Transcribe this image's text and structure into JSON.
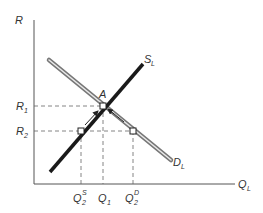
{
  "diagram": {
    "type": "labor-market-supply-demand",
    "axes": {
      "y_label": "R",
      "x_label": "Q",
      "x_label_sub": "L"
    },
    "curves": {
      "supply": {
        "label": "S",
        "sub": "L",
        "color": "#222222"
      },
      "demand": {
        "label": "D",
        "sub": "L",
        "color": "#888888"
      }
    },
    "points": {
      "equilibrium": {
        "label": "A"
      }
    },
    "y_ticks": [
      {
        "label": "R",
        "sub": "1"
      },
      {
        "label": "R",
        "sub": "2"
      }
    ],
    "x_ticks": [
      {
        "label": "Q",
        "sub": "2",
        "sup": "S"
      },
      {
        "label": "Q",
        "sub": "1",
        "sup": ""
      },
      {
        "label": "Q",
        "sub": "2",
        "sup": "D"
      }
    ]
  }
}
